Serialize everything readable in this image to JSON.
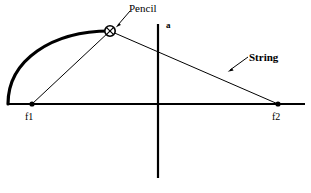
{
  "figure": {
    "title_alt": "Ellipse construction with string and two foci",
    "background_color": "#ffffff",
    "ink_color": "#000000",
    "labels": {
      "pencil": "Pencil",
      "semi_axis": "a",
      "string": "String",
      "focus_left": "f1",
      "focus_right": "f2"
    },
    "geometry": {
      "baseline": {
        "x1": 8,
        "y1": 104,
        "x2": 305,
        "y2": 104
      },
      "vertical_axis": {
        "x": 158,
        "y1": 24,
        "y2": 178
      },
      "focus_left_point": {
        "x": 32,
        "y": 104
      },
      "focus_right_point": {
        "x": 278,
        "y": 104
      },
      "pencil_point": {
        "x": 110,
        "y": 31
      },
      "ellipse_arc": {
        "center_x": 158,
        "center_y": 104,
        "rx": 150,
        "ry": 80
      },
      "string_segment_left": {
        "x1": 32,
        "y1": 104,
        "x2": 110,
        "y2": 31
      },
      "string_segment_right": {
        "x1": 110,
        "y1": 31,
        "x2": 278,
        "y2": 104
      },
      "pencil_leader": {
        "x1": 128,
        "y1": 11,
        "x2": 116,
        "y2": 26
      },
      "string_leader": {
        "x1": 247,
        "y1": 57,
        "x2": 228,
        "y2": 71
      }
    }
  }
}
